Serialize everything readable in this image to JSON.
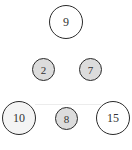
{
  "diagram": {
    "type": "circle-number-puzzle",
    "nodes": [
      {
        "id": "n9",
        "label": "9",
        "size": "large",
        "fill": "white"
      },
      {
        "id": "n2",
        "label": "2",
        "size": "small",
        "fill": "gray"
      },
      {
        "id": "n7",
        "label": "7",
        "size": "small",
        "fill": "gray"
      },
      {
        "id": "n10",
        "label": "10",
        "size": "large",
        "fill": "lightgray"
      },
      {
        "id": "n8",
        "label": "8",
        "size": "small",
        "fill": "gray"
      },
      {
        "id": "n15",
        "label": "15",
        "size": "large",
        "fill": "white"
      }
    ],
    "colors": {
      "stroke": "#2a2a2a",
      "gray_fill": "#dcdcdc",
      "white_fill": "#ffffff",
      "text": "#333333"
    }
  }
}
